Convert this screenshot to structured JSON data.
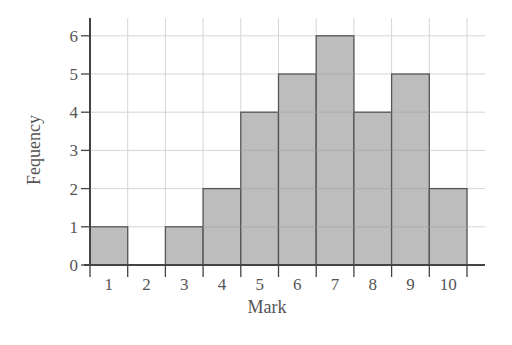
{
  "chart_data": {
    "type": "bar",
    "subtype": "histogram",
    "title": "",
    "xlabel": "Mark",
    "ylabel": "Fequency",
    "categories": [
      "1",
      "2",
      "3",
      "4",
      "5",
      "6",
      "7",
      "8",
      "9",
      "10"
    ],
    "values": [
      1,
      0,
      1,
      2,
      4,
      5,
      6,
      4,
      5,
      2
    ],
    "yticks": [
      0,
      1,
      2,
      3,
      4,
      5,
      6
    ],
    "ylim": [
      0,
      6
    ],
    "grid": true,
    "legend": null,
    "colors": {
      "bar_fill": "#bdbdbd",
      "bar_edge": "#555555",
      "grid": "#d6d6d6",
      "axis": "#444444",
      "text": "#555555"
    }
  }
}
